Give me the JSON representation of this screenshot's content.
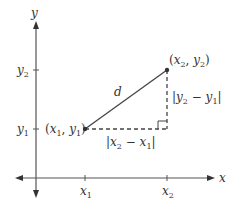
{
  "diagram": {
    "colors": {
      "axis": "#555555",
      "segment": "#444444",
      "dashed": "#444444",
      "text": "#333333"
    },
    "axes": {
      "x_label": "x",
      "y_label": "y"
    },
    "ticks": {
      "x1": "x",
      "x1_sub": "1",
      "x2": "x",
      "x2_sub": "2",
      "y1": "y",
      "y1_sub": "1",
      "y2": "y",
      "y2_sub": "2"
    },
    "points": {
      "p1": {
        "open": "(",
        "a": "x",
        "a_sub": "1",
        "sep": ", ",
        "b": "y",
        "b_sub": "1",
        "close": ")"
      },
      "p2": {
        "open": "(",
        "a": "x",
        "a_sub": "2",
        "sep": ", ",
        "b": "y",
        "b_sub": "2",
        "close": ")"
      }
    },
    "segment_label": "d",
    "horizontal_leg": {
      "bar_l": "|",
      "a": "x",
      "a_sub": "2",
      "minus": " − ",
      "b": "x",
      "b_sub": "1",
      "bar_r": "|"
    },
    "vertical_leg": {
      "bar_l": "|",
      "a": "y",
      "a_sub": "2",
      "minus": " − ",
      "b": "y",
      "b_sub": "1",
      "bar_r": "|"
    }
  }
}
